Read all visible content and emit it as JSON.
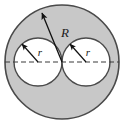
{
  "figure": {
    "canvas": {
      "width": 126,
      "height": 125,
      "background": "#ffffff"
    },
    "colors": {
      "shaded_fill": "#c8c8c8",
      "hole_fill": "#ffffff",
      "outline": "#4a4a4a",
      "dash_line": "#3a3a3a",
      "arrow": "#111111",
      "label": "#1a1a1a"
    },
    "shapes": {
      "outer_circle": {
        "name": "outer-circle",
        "cx": 62,
        "cy": 62,
        "r": 57,
        "fill": "#c8c8c8",
        "stroke": "#4a4a4a"
      },
      "left_circle": {
        "name": "left-inner-circle",
        "cx": 38,
        "cy": 62,
        "r": 24,
        "fill": "#ffffff",
        "stroke": "#4a4a4a"
      },
      "right_circle": {
        "name": "right-inner-circle",
        "cx": 86,
        "cy": 62,
        "r": 24,
        "fill": "#ffffff",
        "stroke": "#4a4a4a"
      }
    },
    "axis_line": {
      "name": "horizontal-dashed-axis",
      "x1": 5,
      "y1": 62,
      "x2": 119,
      "y2": 62,
      "dash": "5 3",
      "color": "#3a3a3a"
    },
    "radius_arrows": [
      {
        "id": "R",
        "name": "outer-radius-arrow",
        "from_x": 62,
        "from_y": 62,
        "to_x": 42,
        "to_y": 13,
        "label": "R",
        "label_x": 65,
        "label_y": 37,
        "label_size": "major"
      },
      {
        "id": "r-left",
        "name": "left-radius-arrow",
        "from_x": 38,
        "from_y": 62,
        "to_x": 22,
        "to_y": 44,
        "label": "r",
        "label_x": 40,
        "label_y": 56,
        "label_size": "minor"
      },
      {
        "id": "r-right",
        "name": "right-radius-arrow",
        "from_x": 86,
        "from_y": 62,
        "to_x": 70,
        "to_y": 44,
        "label": "r",
        "label_x": 88,
        "label_y": 56,
        "label_size": "minor"
      }
    ],
    "labels": {
      "outer_radius": "R",
      "inner_radius_left": "r",
      "inner_radius_right": "r"
    }
  }
}
